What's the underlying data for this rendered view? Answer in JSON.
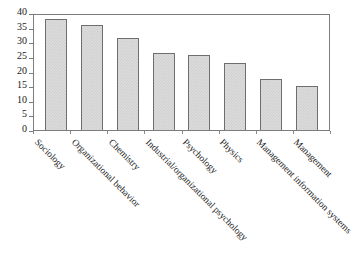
{
  "chart_data": {
    "type": "bar",
    "title": "",
    "subtitle": "",
    "xlabel": "",
    "ylabel": "",
    "ylim": [
      0,
      40
    ],
    "yticks": [
      0,
      5,
      10,
      15,
      20,
      25,
      30,
      35,
      40
    ],
    "grid": false,
    "legend": false,
    "categories": [
      "Sociology",
      "Organizational behavior",
      "Chemistry",
      "Industrial/organizational psychology",
      "Psychology",
      "Physics",
      "Management information systems",
      "Management"
    ],
    "values": [
      38,
      36,
      31.5,
      26.5,
      25.5,
      23,
      17.5,
      15
    ],
    "bar_fill_color": "#dcdcdc",
    "bar_border_color": "#6e6e6e",
    "axis_color": "#7d7d7d",
    "label_rotation_deg": 45
  },
  "figure": {
    "caption": ""
  }
}
